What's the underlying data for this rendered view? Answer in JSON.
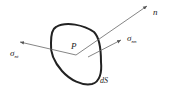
{
  "diagram": {
    "labels": {
      "normal": "n",
      "point": "P",
      "sigma_left": "σ",
      "sigma_left_sub": "nt",
      "sigma_right": "σ",
      "sigma_right_sub": "nn",
      "surface": "dS"
    },
    "colors": {
      "stroke": "#222222",
      "arrow": "#555555"
    }
  }
}
